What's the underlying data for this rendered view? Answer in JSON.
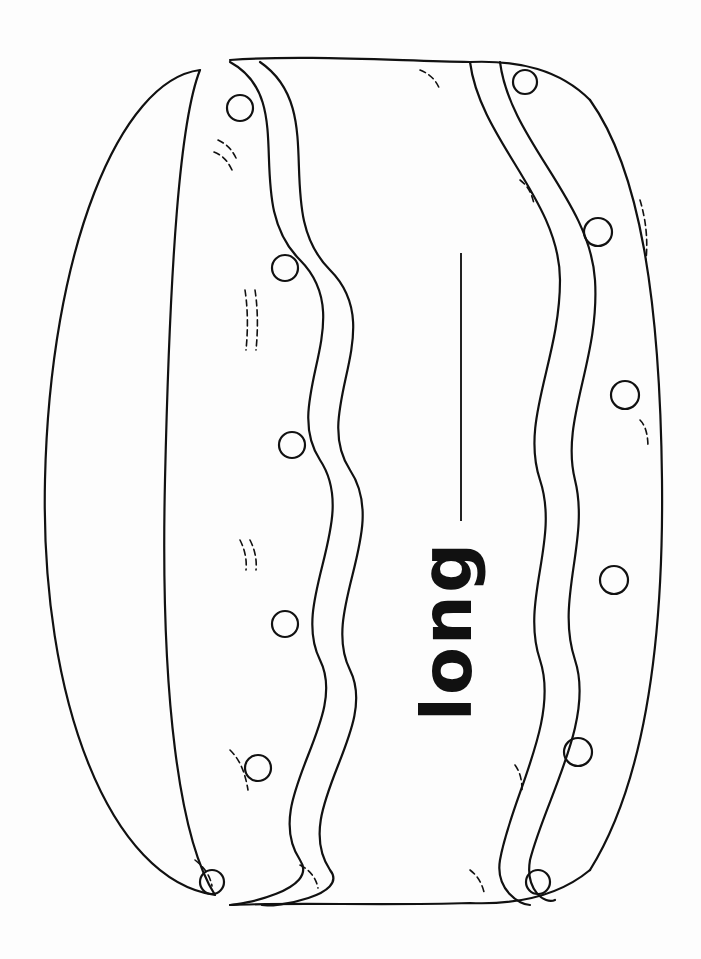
{
  "worksheet": {
    "word": "long",
    "illustration": "drum-icon",
    "orientation": "rotated-90-ccw",
    "writing_line": "blank line for handwriting"
  },
  "colors": {
    "ink": "#111111",
    "paper": "#fdfdfd"
  }
}
